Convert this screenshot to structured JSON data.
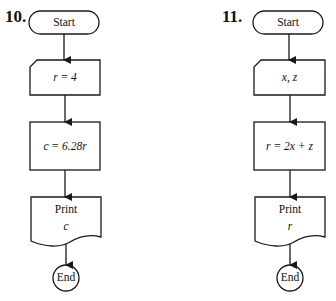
{
  "flowcharts": [
    {
      "number": "10.",
      "nodes": [
        {
          "type": "terminator",
          "label": "Start"
        },
        {
          "type": "input",
          "label": "r = 4"
        },
        {
          "type": "process",
          "label": "c = 6.28r"
        },
        {
          "type": "output-document",
          "label": "Print",
          "sublabel": "c"
        },
        {
          "type": "terminator-circle",
          "label": "End"
        }
      ]
    },
    {
      "number": "11.",
      "nodes": [
        {
          "type": "terminator",
          "label": "Start"
        },
        {
          "type": "input",
          "label": "x, z"
        },
        {
          "type": "process",
          "label": "r = 2x + z"
        },
        {
          "type": "output-document",
          "label": "Print",
          "sublabel": "r"
        },
        {
          "type": "terminator-circle",
          "label": "End"
        }
      ]
    }
  ],
  "colors": {
    "stroke": "#1a1a1a",
    "background": "#ffffff"
  }
}
